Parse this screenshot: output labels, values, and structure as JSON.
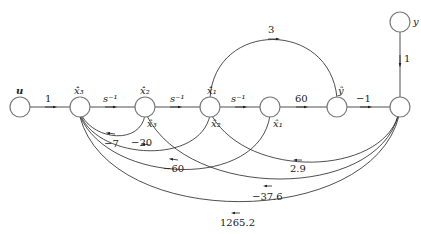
{
  "diagram": {
    "type": "signal-flow-graph",
    "nodes": {
      "u": {
        "label": "u"
      },
      "x3dot": {
        "label": "x̂̇₃"
      },
      "n_x2dot_x3": {
        "label_top": "x̂̇₂",
        "label_bottom": "x̂₃"
      },
      "n_x1dot_x2": {
        "label_top": "x̂̇₁",
        "label_bottom": "x̂₂"
      },
      "n_x1": {
        "label_bottom": "x̂₁"
      },
      "n_yhat": {
        "label_top": "ŷ"
      },
      "n_right": {},
      "y": {
        "label": "y"
      }
    },
    "edges": {
      "u_to_x3dot": "1",
      "integrator_1": "s⁻¹",
      "integrator_2": "s⁻¹",
      "integrator_3": "s⁻¹",
      "x1_to_yhat": "60",
      "yhat_to_right": "−1",
      "y_to_right": "1",
      "x1dot_to_yhat": "3",
      "fb_x3_to_x3dot": "−7",
      "fb_x2_to_x3dot": "−20",
      "fb_x1_to_x3dot": "−60",
      "right_to_x1dot": "2.9",
      "right_to_x2dot": "−37.6",
      "right_to_x3dot": "1265.2"
    }
  }
}
